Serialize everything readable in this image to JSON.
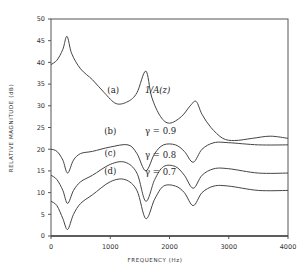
{
  "chart_data": {
    "type": "line",
    "title": "",
    "xlabel": "FREQUENCY (Hz)",
    "ylabel": "RELATIVE MAGNITUDE (dB)",
    "xlim": [
      0,
      4000
    ],
    "ylim": [
      0,
      50
    ],
    "xticks": [
      0,
      1000,
      2000,
      3000,
      4000
    ],
    "yticks": [
      0,
      5,
      10,
      15,
      20,
      25,
      30,
      35,
      40,
      45,
      50
    ],
    "grid": false,
    "legend": "none (inline curve annotations)",
    "series": [
      {
        "name": "(a) 1/A(z)",
        "label": "(a)",
        "annotation": "1/A(z)",
        "x": [
          0,
          100,
          200,
          270,
          350,
          500,
          700,
          900,
          1100,
          1300,
          1450,
          1600,
          1700,
          1850,
          2000,
          2200,
          2350,
          2450,
          2550,
          2700,
          2900,
          3100,
          3400,
          3700,
          4000
        ],
        "y": [
          39.5,
          40.5,
          43,
          46,
          42,
          38.5,
          36,
          33,
          30.5,
          31,
          33,
          38,
          32,
          27.5,
          26,
          27.5,
          30,
          31,
          28,
          25,
          22.5,
          22,
          22.5,
          23,
          22.5
        ]
      },
      {
        "name": "(b) gamma = 0.9",
        "label": "(b)",
        "annotation": "γ = 0.9",
        "x": [
          0,
          100,
          200,
          280,
          380,
          500,
          700,
          1000,
          1300,
          1450,
          1600,
          1750,
          1900,
          2100,
          2250,
          2400,
          2550,
          2750,
          3000,
          3500,
          4000
        ],
        "y": [
          20,
          19.5,
          17.5,
          14.5,
          17.5,
          19,
          19.5,
          20.5,
          21,
          19,
          15,
          19,
          21,
          21,
          19.5,
          17,
          20,
          21.5,
          21.5,
          21,
          21
        ]
      },
      {
        "name": "(c) gamma = 0.8",
        "label": "(c)",
        "annotation": "γ = 0.8",
        "x": [
          0,
          100,
          200,
          280,
          380,
          500,
          700,
          1000,
          1250,
          1450,
          1600,
          1750,
          1900,
          2100,
          2250,
          2400,
          2550,
          2750,
          3000,
          3500,
          4000
        ],
        "y": [
          14,
          13,
          10.5,
          7.5,
          10.5,
          12.5,
          14,
          16.5,
          17,
          14.5,
          8,
          13,
          16,
          16,
          14,
          11,
          14,
          15.5,
          15.5,
          14.5,
          14.5
        ]
      },
      {
        "name": "(d) gamma = 0.7",
        "label": "(d)",
        "annotation": "γ = 0.7",
        "x": [
          0,
          100,
          200,
          280,
          380,
          500,
          700,
          1000,
          1250,
          1450,
          1600,
          1750,
          1900,
          2100,
          2250,
          2400,
          2550,
          2750,
          3000,
          3500,
          4000
        ],
        "y": [
          8,
          7,
          4,
          1.5,
          5,
          7.5,
          9.5,
          12.5,
          13,
          10.5,
          4,
          8.5,
          11.5,
          11.5,
          10,
          7,
          10,
          11.5,
          11.5,
          10.5,
          10.5
        ]
      }
    ],
    "annotations": [
      {
        "text": "(a)",
        "x": 1050,
        "y": 33
      },
      {
        "text": "1/A(z)",
        "x": 1800,
        "y": 33
      },
      {
        "text": "(b)",
        "x": 1000,
        "y": 23.5
      },
      {
        "text": "γ = 0.9",
        "x": 1850,
        "y": 23.5
      },
      {
        "text": "(c)",
        "x": 1000,
        "y": 18.5
      },
      {
        "text": "γ = 0.8",
        "x": 1850,
        "y": 18
      },
      {
        "text": "(d)",
        "x": 1000,
        "y": 14.3
      },
      {
        "text": "γ = 0.7",
        "x": 1850,
        "y": 14
      }
    ]
  },
  "axes": {
    "xlabel": "FREQUENCY (Hz)",
    "ylabel": "RELATIVE MAGNITUDE (dB)",
    "xtick_labels": [
      "0",
      "1000",
      "2000",
      "3000",
      "4000"
    ],
    "ytick_labels": [
      "0",
      "5",
      "10",
      "15",
      "20",
      "25",
      "30",
      "35",
      "40",
      "45",
      "50"
    ]
  }
}
